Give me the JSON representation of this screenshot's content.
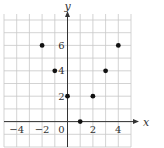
{
  "chart_data": {
    "type": "scatter",
    "title": "",
    "xlabel": "x",
    "ylabel": "y",
    "xlim": [
      -5,
      5
    ],
    "ylim": [
      -2,
      8
    ],
    "grid": true,
    "x_ticks": [
      -4,
      -2,
      0,
      2,
      4
    ],
    "x_tick_labels": [
      "−4",
      "−2",
      "0",
      "2",
      "4"
    ],
    "y_ticks": [
      2,
      4,
      6
    ],
    "y_tick_labels": [
      "2",
      "4",
      "6"
    ],
    "points": [
      {
        "x": -2,
        "y": 6
      },
      {
        "x": -1,
        "y": 4
      },
      {
        "x": 0,
        "y": 2
      },
      {
        "x": 1,
        "y": 0
      },
      {
        "x": 2,
        "y": 2
      },
      {
        "x": 3,
        "y": 4
      },
      {
        "x": 4,
        "y": 6
      }
    ],
    "point_color": "#111111",
    "grid_color": "#c8c8c8",
    "axis_color": "#333333"
  }
}
